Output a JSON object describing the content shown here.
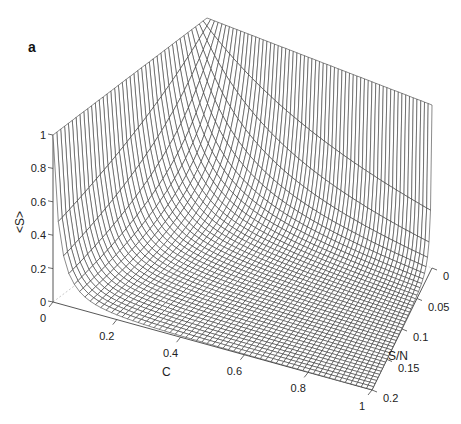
{
  "panel_label": "a",
  "chart_data": {
    "type": "surface",
    "title": "",
    "panel": "a",
    "x": {
      "label": "C",
      "range": [
        0,
        1
      ],
      "ticks": [
        "0",
        "0.2",
        "0.4",
        "0.6",
        "0.8",
        "1"
      ]
    },
    "y": {
      "label": "S/N",
      "range": [
        0,
        0.2
      ],
      "ticks": [
        "0",
        "0.05",
        "0.1",
        "0.15",
        "0.2"
      ]
    },
    "z": {
      "label": "<S>",
      "range": [
        0,
        1
      ],
      "ticks": [
        "0",
        "0.2",
        "0.4",
        "0.6",
        "0.8",
        "1"
      ]
    },
    "grid": false,
    "mesh": {
      "c_lines": 60,
      "sn_lines": 40,
      "line_color": "#2a2a2a",
      "face_color": "#ffffff"
    },
    "sample_points": [
      {
        "C": 0,
        "SN": 0,
        "S": 1.0
      },
      {
        "C": 0,
        "SN": 0.2,
        "S": 1.0
      },
      {
        "C": 1,
        "SN": 0,
        "S": 0.98
      },
      {
        "C": 1,
        "SN": 0.2,
        "S": 0.0
      },
      {
        "C": 0.2,
        "SN": 0.1,
        "S": 0.05
      },
      {
        "C": 0.05,
        "SN": 0.1,
        "S": 0.3
      }
    ]
  },
  "axes": {
    "z_label": "<S>",
    "x_label": "C",
    "y_label": "S/N",
    "z_ticks": [
      "0",
      "0.2",
      "0.4",
      "0.6",
      "0.8",
      "1"
    ],
    "x_ticks": [
      "0",
      "0.2",
      "0.4",
      "0.6",
      "0.8",
      "1"
    ],
    "y_ticks": [
      "0",
      "0.05",
      "0.1",
      "0.15",
      "0.2"
    ]
  }
}
